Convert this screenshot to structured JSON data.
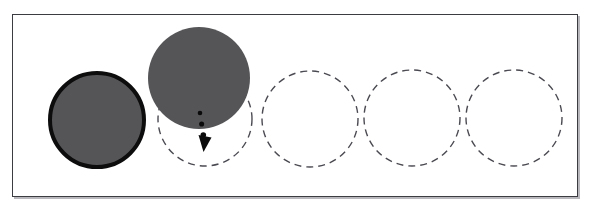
{
  "figure": {
    "background_color": "#ffffff",
    "frame": {
      "x": 12,
      "y": 14,
      "width": 566,
      "height": 183,
      "border_color": "#3b3b42",
      "border_width": 1,
      "shadow_color": "#b9b9bd"
    }
  },
  "colors": {
    "ball_fill": "#555558",
    "ball_outline": "#0d0d0d",
    "slot_dash": "#4a4a52",
    "arrow": "#0b0b0b"
  },
  "slots": [
    {
      "id": "slot-1",
      "label": "1",
      "cx": 97,
      "cy": 120,
      "r": 47,
      "state": "filled",
      "dashed": true
    },
    {
      "id": "slot-2",
      "label": "2",
      "cx": 205,
      "cy": 119,
      "r": 47,
      "state": "target",
      "dashed": true
    },
    {
      "id": "slot-3",
      "label": "3",
      "cx": 310,
      "cy": 119,
      "r": 48,
      "state": "empty",
      "dashed": true
    },
    {
      "id": "slot-4",
      "label": "4",
      "cx": 412,
      "cy": 118,
      "r": 48,
      "state": "empty",
      "dashed": true
    },
    {
      "id": "slot-5",
      "label": "5",
      "cx": 514,
      "cy": 118,
      "r": 48,
      "state": "empty",
      "dashed": true
    }
  ],
  "balls": [
    {
      "id": "ball-placed",
      "name": "placed-ball",
      "cx": 97,
      "cy": 120,
      "r": 47,
      "fill": "#555558",
      "stroke": "#0d0d0d",
      "stroke_width": 4,
      "state": "settled"
    },
    {
      "id": "ball-moving",
      "name": "moving-ball",
      "cx": 199,
      "cy": 78,
      "r": 51,
      "fill": "#555558",
      "stroke": "none",
      "stroke_width": 0,
      "state": "in-transit"
    }
  ],
  "arrow": {
    "name": "drop-arrow",
    "direction": "down",
    "style": "dotted",
    "from_x": 200,
    "from_y": 113,
    "to_x": 206,
    "to_y": 152,
    "dot_count": 3,
    "color": "#0b0b0b"
  },
  "dash_pattern": {
    "dash": 7,
    "gap": 5,
    "stroke_width": 1.4
  }
}
